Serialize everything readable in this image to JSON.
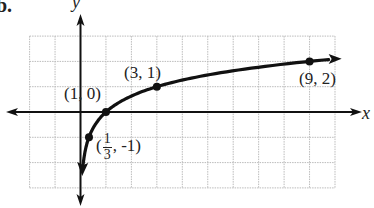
{
  "problem_label": "b.",
  "chart_data": {
    "type": "line",
    "title": "",
    "function": "y = log_3(x)",
    "xlabel": "x",
    "ylabel": "y",
    "grid": true,
    "xlim": [
      -3,
      10
    ],
    "ylim": [
      -3,
      3
    ],
    "points": [
      {
        "x": 0.3333,
        "y": -1,
        "label": "(1/3, -1)"
      },
      {
        "x": 1,
        "y": 0,
        "label": "(1, 0)"
      },
      {
        "x": 3,
        "y": 1,
        "label": "(3, 1)"
      },
      {
        "x": 9,
        "y": 2,
        "label": "(9, 2)"
      }
    ],
    "annotations": [
      "(1, 0)",
      "(3, 1)",
      "(9, 2)",
      "(1/3, -1)"
    ],
    "arrows": {
      "curve_left_end": "down toward vertical asymptote x=0",
      "curve_right_end": "right"
    },
    "colors": {
      "curve": "#111111",
      "axes": "#111111",
      "grid": "#bbbbbb"
    }
  },
  "labels": {
    "x_axis": "x",
    "y_axis": "y",
    "p1": "(1, 0)",
    "p2": "(3, 1)",
    "p3": "(9, 2)",
    "p4_open": "(",
    "p4_num": "1",
    "p4_den": "3",
    "p4_close": ", -1)"
  }
}
